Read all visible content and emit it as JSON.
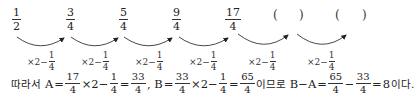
{
  "sequence": {
    "terms": [
      {
        "num": "1",
        "den": "2"
      },
      {
        "num": "3",
        "den": "4"
      },
      {
        "num": "5",
        "den": "4"
      },
      {
        "num": "9",
        "den": "4"
      },
      {
        "num": "17",
        "den": "4"
      }
    ],
    "blanks": [
      {
        "open": "(",
        "close": ")"
      },
      {
        "open": "(",
        "close": ")"
      }
    ],
    "rule": {
      "op": "×2−",
      "num": "1",
      "den": "4"
    }
  },
  "solution": {
    "prefix": "따라서",
    "A_label": "A",
    "eq": "=",
    "a_frac1": {
      "num": "17",
      "den": "4"
    },
    "times2minus": "×2−",
    "one_quarter": {
      "num": "1",
      "den": "4"
    },
    "a_result": {
      "num": "33",
      "den": "4"
    },
    "comma": ",",
    "B_label": "B",
    "b_frac1": {
      "num": "33",
      "den": "4"
    },
    "b_result": {
      "num": "65",
      "den": "4"
    },
    "imeuro": "이므로",
    "BminusA": "B−A",
    "diff_frac1": {
      "num": "65",
      "den": "4"
    },
    "minus": "−",
    "diff_frac2": {
      "num": "33",
      "den": "4"
    },
    "answer": "8",
    "suffix": "이다."
  }
}
